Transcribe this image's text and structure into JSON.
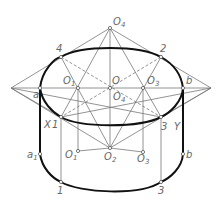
{
  "diagram": {
    "labels": {
      "O4_top": "O",
      "O4_top_sub": "4",
      "pt4": "4",
      "pt2": "2",
      "a": "a",
      "b": "b",
      "O": "O",
      "O1": "O",
      "O1_sub": "1",
      "O3": "O",
      "O3_sub": "3",
      "O4_mid": "O",
      "O4_mid_sub": "4",
      "X": "X",
      "pt1_upper": "1",
      "pt3_upper": "3",
      "Y": "Y",
      "a1": "a",
      "a1_sub": "1",
      "O1_low": "O",
      "O1_low_sub": "1",
      "O2": "O",
      "O2_sub": "2",
      "O3_low": "O",
      "O3_low_sub": "3",
      "b_low": "b",
      "pt1_lower": "1",
      "pt3_lower": "3"
    },
    "colors": {
      "construction_line": "#777777",
      "outline": "#111111",
      "label": "#666666"
    }
  }
}
